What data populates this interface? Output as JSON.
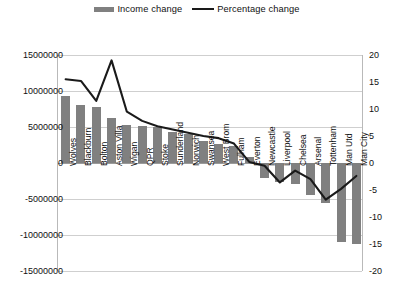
{
  "legend": {
    "position": "top-center",
    "entries": [
      {
        "label": "Income change",
        "marker": "bar-swatch-icon",
        "color": "#808080"
      },
      {
        "label": "Percentage change",
        "marker": "line-swatch-icon",
        "color": "#1a1a1a"
      }
    ]
  },
  "axes": {
    "left_ticks": [
      "15000000",
      "10000000",
      "5000000",
      "0",
      "-5000000",
      "-10000000",
      "-15000000"
    ],
    "right_ticks": [
      "20",
      "15",
      "10",
      "5",
      "0",
      "-5",
      "-10",
      "-15",
      "-20"
    ]
  },
  "chart_data": {
    "type": "bar",
    "title": "",
    "subtitle": "",
    "xlabel": "",
    "ylabel": "",
    "y2label": "",
    "grid": true,
    "legend_position": "top-center",
    "ylim": [
      -15000000,
      15000000
    ],
    "y2lim": [
      -20,
      20
    ],
    "yticks": [
      15000000,
      10000000,
      5000000,
      0,
      -5000000,
      -10000000,
      -15000000
    ],
    "y2ticks": [
      20,
      15,
      10,
      5,
      0,
      -5,
      -10,
      -15,
      -20
    ],
    "categories": [
      "Wolves",
      "Blackburn",
      "Bolton",
      "Aston Villa",
      "Wigan",
      "QPR",
      "Stoke",
      "Sunderland",
      "Norwich",
      "Swansea",
      "West Brom",
      "Fulham",
      "Everton",
      "Newcastle",
      "Liverpool",
      "Chelsea",
      "Arsenal",
      "Tottenham",
      "Man Utd",
      "Man City"
    ],
    "series": [
      {
        "name": "Income change",
        "type": "bar",
        "axis": "left",
        "color": "#808080",
        "values": [
          9300000,
          8000000,
          7800000,
          6300000,
          5300000,
          5200000,
          5000000,
          4300000,
          4000000,
          3000000,
          2600000,
          2300000,
          900000,
          -2100000,
          -2600000,
          -2900000,
          -4500000,
          -5600000,
          -11000000,
          -11200000
        ]
      },
      {
        "name": "Percentage change",
        "type": "line",
        "axis": "right",
        "color": "#1a1a1a",
        "values": [
          15.5,
          15.2,
          11.5,
          19.0,
          9.5,
          7.8,
          6.8,
          6.2,
          5.6,
          5.0,
          4.6,
          3.6,
          0.2,
          -0.5,
          -3.6,
          -1.4,
          -3.0,
          -6.8,
          -4.8,
          -2.4
        ]
      }
    ]
  }
}
